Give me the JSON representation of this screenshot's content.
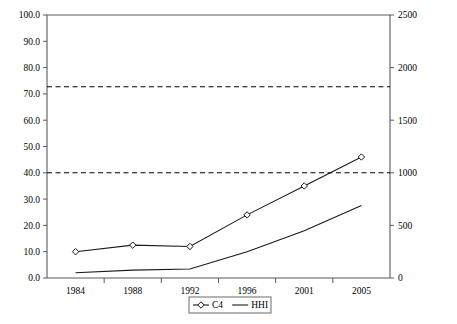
{
  "chart_data": {
    "type": "line",
    "title": "",
    "xlabel": "",
    "ylabel": "",
    "categories": [
      "1984",
      "1988",
      "1992",
      "1996",
      "2001",
      "2005"
    ],
    "series": [
      {
        "name": "C4",
        "axis": "left",
        "marker": "diamond",
        "values": [
          10.0,
          12.5,
          12.0,
          24.0,
          35.0,
          46.0
        ]
      },
      {
        "name": "HHI",
        "axis": "right",
        "marker": "none",
        "values": [
          50,
          75,
          85,
          250,
          450,
          690
        ]
      }
    ],
    "left_axis": {
      "min": 0.0,
      "max": 100.0,
      "step": 10.0,
      "ticks": [
        "0.0",
        "10.0",
        "20.0",
        "30.0",
        "40.0",
        "50.0",
        "60.0",
        "70.0",
        "80.0",
        "90.0",
        "100.0"
      ],
      "tick_values": [
        0,
        10,
        20,
        30,
        40,
        50,
        60,
        70,
        80,
        90,
        100
      ]
    },
    "right_axis": {
      "min": 0,
      "max": 2500,
      "step": 500,
      "ticks": [
        "0",
        "500",
        "1000",
        "1500",
        "2000",
        "2500"
      ],
      "tick_values": [
        0,
        500,
        1000,
        1500,
        2000,
        2500
      ]
    },
    "thresholds": [
      {
        "name": "c4-threshold",
        "left_value": 40.0,
        "right_value": 1000
      },
      {
        "name": "hhi-threshold",
        "left_value": 72.7,
        "right_value": 1800
      }
    ],
    "grid": false,
    "legend": {
      "position": "bottom",
      "entries": [
        {
          "label": "C4",
          "marker": "diamond"
        },
        {
          "label": "HHI",
          "marker": "none"
        }
      ]
    },
    "colors": {
      "line": "#1a1a1a",
      "axis": "#5a5a5a",
      "background": "#ffffff"
    }
  }
}
